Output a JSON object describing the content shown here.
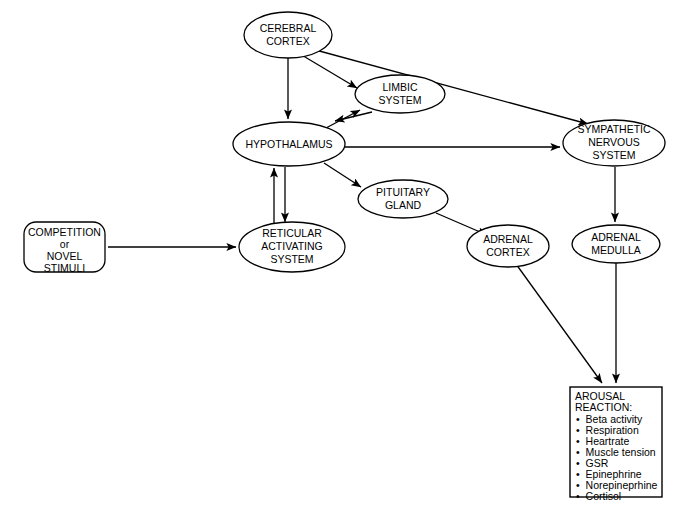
{
  "diagram": {
    "type": "flowchart",
    "background_color": "#ffffff",
    "line_color": "#000000",
    "nodes": [
      {
        "id": "cerebral-cortex",
        "shape": "ellipse",
        "lines": [
          "CEREBRAL",
          "CORTEX"
        ],
        "cx": 288,
        "cy": 35,
        "rx": 44,
        "ry": 23
      },
      {
        "id": "limbic-system",
        "shape": "ellipse",
        "lines": [
          "LIMBIC",
          "SYSTEM"
        ],
        "cx": 400,
        "cy": 94,
        "rx": 45,
        "ry": 19
      },
      {
        "id": "hypothalamus",
        "shape": "ellipse",
        "lines": [
          "HYPOTHALAMUS"
        ],
        "cx": 289,
        "cy": 144,
        "rx": 56,
        "ry": 22
      },
      {
        "id": "sympathetic-nervous-system",
        "shape": "ellipse",
        "lines": [
          "SYMPATHETIC",
          "NERVOUS",
          "SYSTEM"
        ],
        "cx": 614,
        "cy": 143,
        "rx": 51,
        "ry": 23
      },
      {
        "id": "pituitary-gland",
        "shape": "ellipse",
        "lines": [
          "PITUITARY",
          "GLAND"
        ],
        "cx": 403,
        "cy": 199,
        "rx": 45,
        "ry": 19
      },
      {
        "id": "reticular-activating-system",
        "shape": "ellipse",
        "lines": [
          "RETICULAR",
          "ACTIVATING",
          "SYSTEM"
        ],
        "cx": 292,
        "cy": 247,
        "rx": 53,
        "ry": 25
      },
      {
        "id": "adrenal-cortex",
        "shape": "ellipse",
        "lines": [
          "ADRENAL",
          "CORTEX"
        ],
        "cx": 508,
        "cy": 246,
        "rx": 41,
        "ry": 21
      },
      {
        "id": "adrenal-medulla",
        "shape": "ellipse",
        "lines": [
          "ADRENAL",
          "MEDULLA"
        ],
        "cx": 616,
        "cy": 244,
        "rx": 44,
        "ry": 19
      },
      {
        "id": "competition-or-novel-stimuli",
        "shape": "rounded-rect",
        "lines": [
          "COMPETITION",
          "or",
          "NOVEL",
          "STIMULI"
        ],
        "x": 24,
        "y": 222,
        "w": 81,
        "h": 50,
        "r": 12
      }
    ],
    "arousal_box": {
      "id": "arousal-reaction-box",
      "shape": "rect",
      "x": 570,
      "y": 387,
      "w": 92,
      "h": 110,
      "title_lines": [
        "AROUSAL",
        "REACTION:"
      ],
      "items": [
        "Beta activity",
        "Respiration",
        "Heartrate",
        "Muscle tension",
        "GSR",
        "Epinephrine",
        "Norepineprhine",
        "Cortisol"
      ],
      "bullet": "•"
    },
    "edges": [
      {
        "id": "cerebral-cortex-to-hypothalamus",
        "from": "cerebral-cortex",
        "to": "hypothalamus",
        "path": "M 288 58 L 288 119",
        "arrow": true
      },
      {
        "id": "cerebral-cortex-to-limbic-system",
        "from": "cerebral-cortex",
        "to": "limbic-system",
        "path": "M 303 53 L 356 87",
        "arrow": true
      },
      {
        "id": "cerebral-cortex-to-sympathetic-nervous-system",
        "from": "cerebral-cortex",
        "to": "sympathetic-nervous-system",
        "path": "M 314 48 L 590 125",
        "arrow": true
      },
      {
        "id": "limbic-system-to-hypothalamus",
        "from": "limbic-system",
        "to": "hypothalamus",
        "path": "M 359 107 L 334 119",
        "arrow": true
      },
      {
        "id": "hypothalamus-to-limbic-system",
        "from": "hypothalamus",
        "to": "limbic-system",
        "path": "M 327 128 L 361 111",
        "arrow": true
      },
      {
        "id": "hypothalamus-to-sympathetic-nervous-system",
        "from": "hypothalamus",
        "to": "sympathetic-nervous-system",
        "path": "M 345 147 L 560 147",
        "arrow": true
      },
      {
        "id": "hypothalamus-to-pituitary-gland",
        "from": "hypothalamus",
        "to": "pituitary-gland",
        "path": "M 322 162 L 360 187",
        "arrow": true
      },
      {
        "id": "hypothalamus-to-reticular-activating-system",
        "from": "hypothalamus",
        "to": "reticular-activating-system",
        "path": "M 285 166 L 285 222",
        "arrow": true
      },
      {
        "id": "reticular-activating-system-to-hypothalamus",
        "from": "reticular-activating-system",
        "to": "hypothalamus",
        "path": "M 274 223 L 274 167",
        "arrow": true
      },
      {
        "id": "competition-to-reticular-activating-system",
        "from": "competition-or-novel-stimuli",
        "to": "reticular-activating-system",
        "path": "M 107 247 L 237 247",
        "arrow": true
      },
      {
        "id": "pituitary-gland-to-adrenal-cortex",
        "from": "pituitary-gland",
        "to": "adrenal-cortex",
        "path": "M 435 213 L 486 234",
        "arrow": true
      },
      {
        "id": "sympathetic-nervous-system-to-adrenal-medulla",
        "from": "sympathetic-nervous-system",
        "to": "adrenal-medulla",
        "path": "M 615 166 L 615 222",
        "arrow": true
      },
      {
        "id": "adrenal-cortex-to-arousal-reaction",
        "from": "adrenal-cortex",
        "to": "arousal-reaction-box",
        "path": "M 517 263 L 603 384",
        "arrow": true
      },
      {
        "id": "adrenal-medulla-to-arousal-reaction",
        "from": "adrenal-medulla",
        "to": "arousal-reaction-box",
        "path": "M 616 263 L 616 384",
        "arrow": true
      }
    ]
  },
  "caption": {
    "text": ""
  }
}
